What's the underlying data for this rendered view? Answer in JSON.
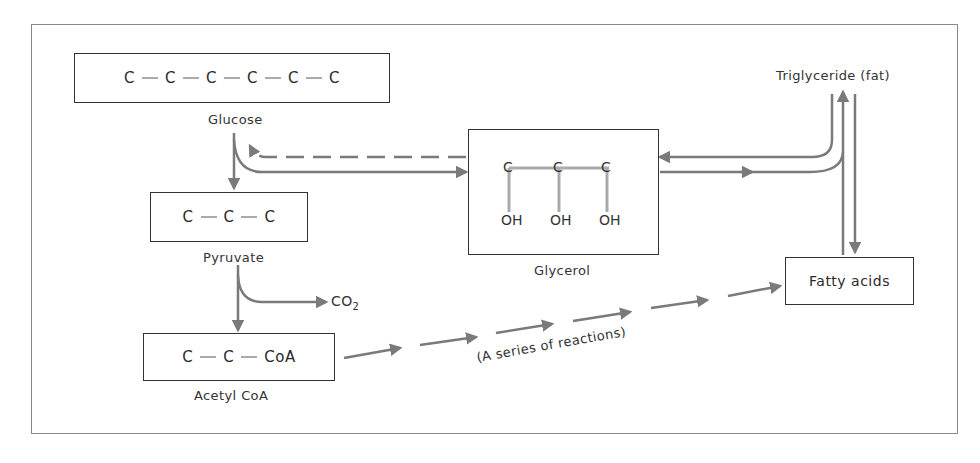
{
  "diagram": {
    "type": "metabolic-pathway",
    "colors": {
      "arrow": "#7a7a7a",
      "box_border": "#333333",
      "bond": "#aaaaaa",
      "frame": "#8a8a8a"
    },
    "nodes": {
      "glucose": {
        "label": "Glucose",
        "chain": [
          "C",
          "C",
          "C",
          "C",
          "C",
          "C"
        ]
      },
      "pyruvate": {
        "label": "Pyruvate",
        "chain": [
          "C",
          "C",
          "C"
        ]
      },
      "acetyl_coa": {
        "label": "Acetyl CoA",
        "chain": [
          "C",
          "C",
          "CoA"
        ]
      },
      "glycerol": {
        "label": "Glycerol",
        "carbons": [
          "C",
          "C",
          "C"
        ],
        "hydroxyls": [
          "OH",
          "OH",
          "OH"
        ]
      },
      "triglyceride": {
        "label": "Triglyceride (fat)"
      },
      "fatty_acids": {
        "label": "Fatty acids"
      },
      "co2": {
        "label": "CO",
        "subscript": "2"
      }
    },
    "edges": [
      {
        "from": "Glucose",
        "to": "Pyruvate",
        "style": "solid"
      },
      {
        "from": "Glucose",
        "to": "Glycerol",
        "style": "solid"
      },
      {
        "from": "Glycerol",
        "to": "Glucose",
        "style": "dashed"
      },
      {
        "from": "Pyruvate",
        "to": "Acetyl CoA",
        "style": "solid"
      },
      {
        "from": "Pyruvate",
        "to": "CO2",
        "style": "solid"
      },
      {
        "from": "Acetyl CoA",
        "to": "Fatty acids",
        "style": "segmented",
        "label": "(A series of reactions)"
      },
      {
        "from": "Glycerol",
        "to": "Triglyceride (fat)",
        "style": "solid"
      },
      {
        "from": "Triglyceride (fat)",
        "to": "Glycerol",
        "style": "solid"
      },
      {
        "from": "Fatty acids",
        "to": "Triglyceride (fat)",
        "style": "solid"
      },
      {
        "from": "Triglyceride (fat)",
        "to": "Fatty acids",
        "style": "solid"
      }
    ],
    "series_label": "(A series of reactions)"
  }
}
